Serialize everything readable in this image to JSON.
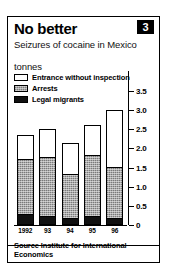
{
  "header": {
    "title": "No better",
    "badge": "3",
    "subtitle": "Seizures of cocaine in Mexico",
    "units": "tonnes"
  },
  "legend": [
    {
      "label": "Entrance without inspection",
      "swatch": "white",
      "color": "#ffffff"
    },
    {
      "label": "Arrests",
      "swatch": "gray",
      "color": "#a9a9a9"
    },
    {
      "label": "Legal migrants",
      "swatch": "black",
      "color": "#111111"
    }
  ],
  "footer": {
    "source": "Source Institute for International Economics"
  },
  "chart_data": {
    "type": "bar",
    "stacked": true,
    "title": "No better",
    "subtitle": "Seizures of cocaine in Mexico",
    "xlabel": "",
    "ylabel": "tonnes",
    "ylim": [
      0,
      3.5
    ],
    "yticks": [
      "0",
      "0.5",
      "1.0",
      "1.5",
      "2.0",
      "2.5",
      "3.0",
      "3.5"
    ],
    "ytick_values": [
      0,
      0.5,
      1.0,
      1.5,
      2.0,
      2.5,
      3.0,
      3.5
    ],
    "grid": false,
    "legend_position": "top-left",
    "categories": [
      "1992",
      "93",
      "94",
      "95",
      "96"
    ],
    "series": [
      {
        "name": "Legal migrants",
        "color": "#111111",
        "values": [
          0.25,
          0.2,
          0.15,
          0.2,
          0.15
        ]
      },
      {
        "name": "Arrests",
        "color": "#a9a9a9",
        "values": [
          1.45,
          1.55,
          1.15,
          1.6,
          1.35
        ]
      },
      {
        "name": "Entrance without inspection",
        "color": "#ffffff",
        "values": [
          0.65,
          0.75,
          0.85,
          0.8,
          1.5
        ]
      }
    ],
    "totals": [
      2.35,
      2.5,
      2.15,
      2.6,
      3.0
    ]
  }
}
